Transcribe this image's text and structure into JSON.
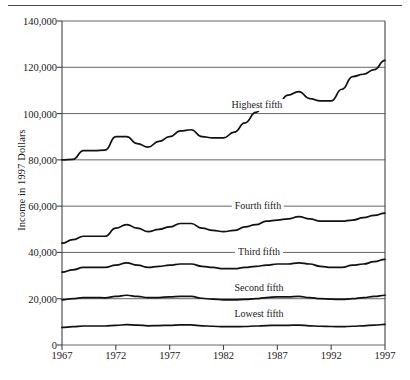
{
  "chart_data": {
    "type": "line",
    "title": "",
    "subtitle": "",
    "xlabel": "",
    "ylabel": "Income in 1997 Dollars",
    "xlim": [
      1967,
      1997
    ],
    "ylim": [
      0,
      140000
    ],
    "grid": true,
    "grid_axis": "y",
    "legend_position": "inline-labels",
    "x": [
      1967,
      1968,
      1969,
      1970,
      1971,
      1972,
      1973,
      1974,
      1975,
      1976,
      1977,
      1978,
      1979,
      1980,
      1981,
      1982,
      1983,
      1984,
      1985,
      1986,
      1987,
      1988,
      1989,
      1990,
      1991,
      1992,
      1993,
      1994,
      1995,
      1996,
      1997
    ],
    "xtick_labels": [
      "1967",
      "1972",
      "1977",
      "1982",
      "1987",
      "1992",
      "1997"
    ],
    "xtick_values": [
      1967,
      1972,
      1977,
      1982,
      1987,
      1992,
      1997
    ],
    "ytick_labels": [
      "0",
      "20,000",
      "40,000",
      "60,000",
      "80,000",
      "100,000",
      "120,000",
      "140,000"
    ],
    "ytick_values": [
      0,
      20000,
      40000,
      60000,
      80000,
      100000,
      120000,
      140000
    ],
    "series": [
      {
        "name": "Highest fifth",
        "label_x": 1985.1,
        "label_y": 103500,
        "values": [
          80000,
          80200,
          84000,
          84000,
          84200,
          90000,
          90000,
          87000,
          85500,
          88000,
          90000,
          92500,
          93000,
          90000,
          89500,
          89500,
          92000,
          96000,
          100500,
          105000,
          104000,
          108000,
          109500,
          106500,
          105500,
          105500,
          110500,
          116000,
          117000,
          119000,
          123000
        ]
      },
      {
        "name": "Fourth fifth",
        "label_x": 1985.2,
        "label_y": 60000,
        "values": [
          44000,
          45500,
          47000,
          47000,
          47000,
          50500,
          52000,
          50500,
          49000,
          50000,
          51000,
          52500,
          52500,
          50500,
          49500,
          49000,
          49500,
          51000,
          52000,
          53500,
          54000,
          54500,
          55500,
          54500,
          53500,
          53500,
          53500,
          54000,
          55000,
          56000,
          57000
        ]
      },
      {
        "name": "Third fifth",
        "label_x": 1985.3,
        "label_y": 40000,
        "values": [
          31500,
          32500,
          33500,
          33500,
          33500,
          34500,
          35500,
          34500,
          33500,
          34000,
          34500,
          35000,
          35000,
          34000,
          33500,
          33000,
          33000,
          33500,
          34000,
          34500,
          35000,
          35000,
          35500,
          35000,
          34000,
          33500,
          33500,
          34500,
          35000,
          36000,
          37000
        ]
      },
      {
        "name": "Second fifth",
        "label_x": 1985.3,
        "label_y": 24800,
        "values": [
          19500,
          20000,
          20500,
          20500,
          20400,
          21000,
          21500,
          21000,
          20500,
          20500,
          20800,
          21000,
          21000,
          20200,
          19800,
          19500,
          19500,
          19700,
          20000,
          20500,
          20800,
          20800,
          21000,
          20500,
          20000,
          19800,
          19700,
          20000,
          20500,
          21000,
          21500
        ]
      },
      {
        "name": "Lowest fifth",
        "label_x": 1985.3,
        "label_y": 13500,
        "values": [
          7600,
          7900,
          8200,
          8200,
          8200,
          8500,
          8800,
          8600,
          8300,
          8400,
          8500,
          8700,
          8700,
          8300,
          8100,
          7900,
          7900,
          8000,
          8200,
          8400,
          8500,
          8500,
          8600,
          8300,
          8100,
          8000,
          7900,
          8100,
          8300,
          8600,
          8900
        ]
      }
    ],
    "colors": {
      "line": "#111111",
      "grid": "#555555",
      "axis": "#444444",
      "background": "#ffffff"
    }
  }
}
